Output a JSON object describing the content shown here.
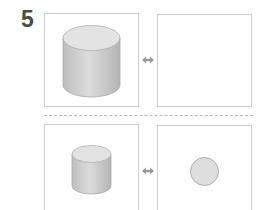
{
  "problem": {
    "number": "5"
  },
  "rows": [
    {
      "left": {
        "shape": "cylinder",
        "size": "large"
      },
      "connector": "double-arrow",
      "right": {
        "shape": "empty"
      }
    },
    {
      "left": {
        "shape": "cylinder",
        "size": "small"
      },
      "connector": "double-arrow",
      "right": {
        "shape": "circle"
      }
    }
  ],
  "colors": {
    "number": "#4a4a4a",
    "border": "#cfcfcf",
    "shape_fill": "#d9d9d9",
    "shape_top": "#e4e4e4",
    "arrow": "#9a9a9a",
    "divider": "#b8b8b8"
  }
}
